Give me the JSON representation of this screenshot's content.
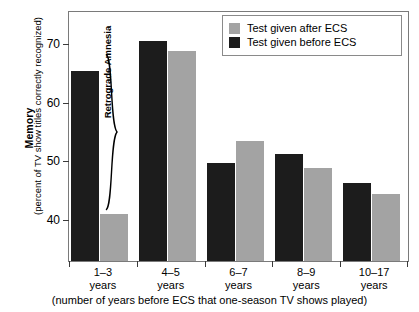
{
  "chart_data": {
    "type": "bar",
    "title": "",
    "xlabel": "(number of years before ECS that one-season TV shows played)",
    "ylabel_main": "Memory",
    "ylabel_sub": "(percent of TV show titles correctly recognized)",
    "categories": [
      "1–3 years",
      "4–5 years",
      "6–7 years",
      "8–9 years",
      "10–17 years"
    ],
    "category_lines": [
      {
        "line1": "1–3",
        "line2": "years"
      },
      {
        "line1": "4–5",
        "line2": "years"
      },
      {
        "line1": "6–7",
        "line2": "years"
      },
      {
        "line1": "8–9",
        "line2": "years"
      },
      {
        "line1": "10–17",
        "line2": "years"
      }
    ],
    "series": [
      {
        "name": "Test given before ECS",
        "color": "#1c1c1c",
        "values": [
          65.5,
          70.5,
          49.7,
          51.3,
          46.3
        ]
      },
      {
        "name": "Test given after ECS",
        "color": "#a3a3a3",
        "values": [
          41.1,
          68.8,
          53.4,
          48.9,
          44.5
        ]
      }
    ],
    "ylim": [
      33.0,
      75.5
    ],
    "yticks": [
      40,
      50,
      60,
      70
    ],
    "ytick_labels": [
      "40",
      "50",
      "60",
      "70"
    ],
    "grid": false,
    "legend_position": "top-right",
    "annotations": [
      {
        "text": "Retrograde Amnesia",
        "type": "brace-label"
      }
    ]
  },
  "legend": {
    "items": [
      {
        "label": "Test given after ECS",
        "color": "#a3a3a3"
      },
      {
        "label": "Test given before ECS",
        "color": "#1c1c1c"
      }
    ]
  },
  "annotation": {
    "retrograde_label": "Retrograde Amnesia"
  },
  "axes": {
    "y_title": "Memory",
    "y_subtitle": "(percent of TV show titles correctly recognized)",
    "x_title": "(number of years before ECS that one-season TV shows played)"
  },
  "colors": {
    "before_ecs": "#1c1c1c",
    "after_ecs": "#a3a3a3",
    "frame": "#7a7a7a",
    "background": "#ffffff"
  }
}
